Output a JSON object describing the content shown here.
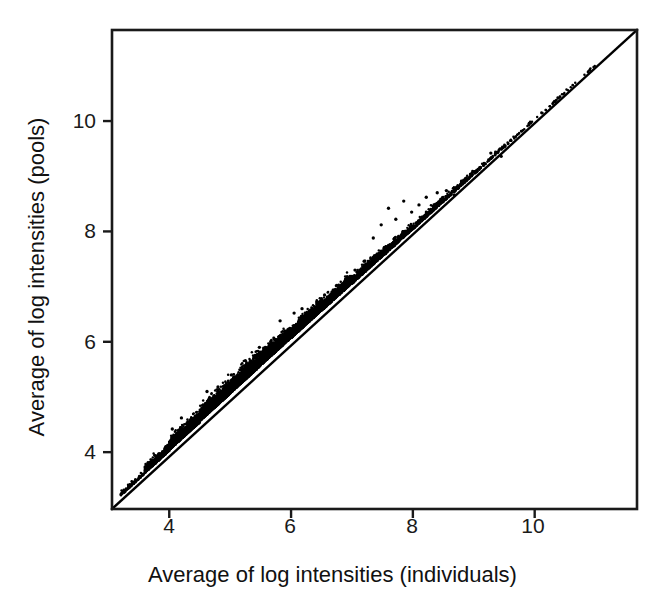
{
  "chart_data": {
    "type": "scatter",
    "title": "",
    "subtitle": "",
    "xlabel": "Average of log intensities (individuals)",
    "ylabel": "Average of log intensities (pools)",
    "xlim": [
      3.06,
      11.68
    ],
    "ylim": [
      2.97,
      11.65
    ],
    "xticks": [
      4,
      6,
      8,
      10
    ],
    "yticks": [
      4,
      6,
      8,
      10
    ],
    "xtick_labels": [
      "4",
      "6",
      "8",
      "10"
    ],
    "ytick_labels": [
      "4",
      "6",
      "8",
      "10"
    ],
    "grid": false,
    "legend": "none",
    "frame": "box",
    "point_color": "#000000",
    "line_color": "#000000",
    "marker": "dot",
    "marker_size": 2,
    "reference_line": {
      "name": "identity-line",
      "type": "y=x",
      "slope": 1,
      "intercept": 0,
      "from": [
        3.06,
        3.06
      ],
      "to": [
        11.68,
        11.68
      ],
      "width": 2
    },
    "n_points": 11000,
    "density_profile": [
      {
        "x": 3.2,
        "offset_mean": 0.02,
        "offset_sd": 0.03,
        "weight": 0.01
      },
      {
        "x": 3.6,
        "offset_mean": 0.05,
        "offset_sd": 0.06,
        "weight": 0.06
      },
      {
        "x": 4.0,
        "offset_mean": 0.08,
        "offset_sd": 0.09,
        "weight": 0.14
      },
      {
        "x": 4.5,
        "offset_mean": 0.11,
        "offset_sd": 0.11,
        "weight": 0.18
      },
      {
        "x": 5.0,
        "offset_mean": 0.12,
        "offset_sd": 0.12,
        "weight": 0.17
      },
      {
        "x": 5.5,
        "offset_mean": 0.12,
        "offset_sd": 0.11,
        "weight": 0.14
      },
      {
        "x": 6.0,
        "offset_mean": 0.11,
        "offset_sd": 0.1,
        "weight": 0.1
      },
      {
        "x": 6.5,
        "offset_mean": 0.1,
        "offset_sd": 0.09,
        "weight": 0.07
      },
      {
        "x": 7.0,
        "offset_mean": 0.08,
        "offset_sd": 0.07,
        "weight": 0.05
      },
      {
        "x": 7.5,
        "offset_mean": 0.07,
        "offset_sd": 0.06,
        "weight": 0.035
      },
      {
        "x": 8.0,
        "offset_mean": 0.06,
        "offset_sd": 0.05,
        "weight": 0.025
      },
      {
        "x": 8.5,
        "offset_mean": 0.05,
        "offset_sd": 0.04,
        "weight": 0.015
      },
      {
        "x": 9.0,
        "offset_mean": 0.04,
        "offset_sd": 0.03,
        "weight": 0.008
      },
      {
        "x": 9.5,
        "offset_mean": 0.03,
        "offset_sd": 0.025,
        "weight": 0.004
      },
      {
        "x": 10.0,
        "offset_mean": 0.02,
        "offset_sd": 0.02,
        "weight": 0.002
      },
      {
        "x": 10.6,
        "offset_mean": 0.02,
        "offset_sd": 0.02,
        "weight": 0.001
      }
    ],
    "outliers": [
      {
        "x": 5.82,
        "y": 6.38
      },
      {
        "x": 5.9,
        "y": 6.16
      },
      {
        "x": 6.05,
        "y": 6.52
      },
      {
        "x": 6.18,
        "y": 6.6
      },
      {
        "x": 6.28,
        "y": 6.47
      },
      {
        "x": 6.42,
        "y": 6.72
      },
      {
        "x": 6.55,
        "y": 6.85
      },
      {
        "x": 6.62,
        "y": 6.78
      },
      {
        "x": 6.75,
        "y": 7.02
      },
      {
        "x": 6.9,
        "y": 7.14
      },
      {
        "x": 7.05,
        "y": 7.3
      },
      {
        "x": 7.2,
        "y": 7.46
      },
      {
        "x": 7.35,
        "y": 7.88
      },
      {
        "x": 7.48,
        "y": 8.12
      },
      {
        "x": 7.6,
        "y": 8.42
      },
      {
        "x": 7.72,
        "y": 8.22
      },
      {
        "x": 7.85,
        "y": 8.55
      },
      {
        "x": 7.98,
        "y": 8.35
      },
      {
        "x": 8.1,
        "y": 8.48
      },
      {
        "x": 8.22,
        "y": 8.62
      },
      {
        "x": 8.4,
        "y": 8.7
      },
      {
        "x": 8.55,
        "y": 8.74
      },
      {
        "x": 8.68,
        "y": 8.66
      },
      {
        "x": 9.28,
        "y": 9.42
      },
      {
        "x": 9.45,
        "y": 9.36
      },
      {
        "x": 4.62,
        "y": 5.1
      },
      {
        "x": 4.8,
        "y": 5.18
      },
      {
        "x": 5.02,
        "y": 5.4
      },
      {
        "x": 5.25,
        "y": 5.66
      },
      {
        "x": 5.48,
        "y": 5.9
      },
      {
        "x": 4.2,
        "y": 4.62
      },
      {
        "x": 4.05,
        "y": 4.42
      }
    ]
  },
  "axes": {
    "x_title": "Average of log intensities (individuals)",
    "y_title": "Average of log intensities (pools)",
    "x_ticks": [
      {
        "label": "4",
        "value": 4
      },
      {
        "label": "6",
        "value": 6
      },
      {
        "label": "8",
        "value": 8
      },
      {
        "label": "10",
        "value": 10
      }
    ],
    "y_ticks": [
      {
        "label": "4",
        "value": 4
      },
      {
        "label": "6",
        "value": 6
      },
      {
        "label": "8",
        "value": 8
      },
      {
        "label": "10",
        "value": 10
      }
    ]
  },
  "colors": {
    "axis": "#1a1a1a",
    "points": "#000000",
    "background": "#ffffff"
  }
}
